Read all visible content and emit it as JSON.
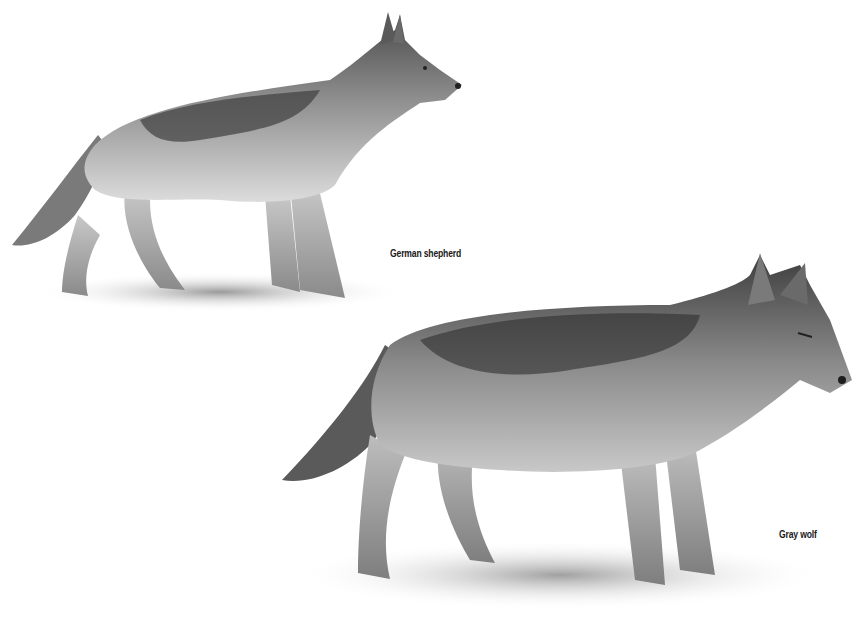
{
  "illustration": {
    "subjects": [
      {
        "id": "german-shepherd",
        "label": "German shepherd",
        "facing": "right",
        "position": "upper-left"
      },
      {
        "id": "gray-wolf",
        "label": "Gray wolf",
        "facing": "right",
        "position": "lower-right"
      }
    ],
    "style": "grayscale pencil drawing",
    "colors": {
      "background": "#ffffff",
      "fur_dark": "#3a3a3a",
      "fur_mid": "#8a8a8a",
      "fur_light": "#d6d6d6",
      "label_text": "#1a1a1a"
    }
  }
}
